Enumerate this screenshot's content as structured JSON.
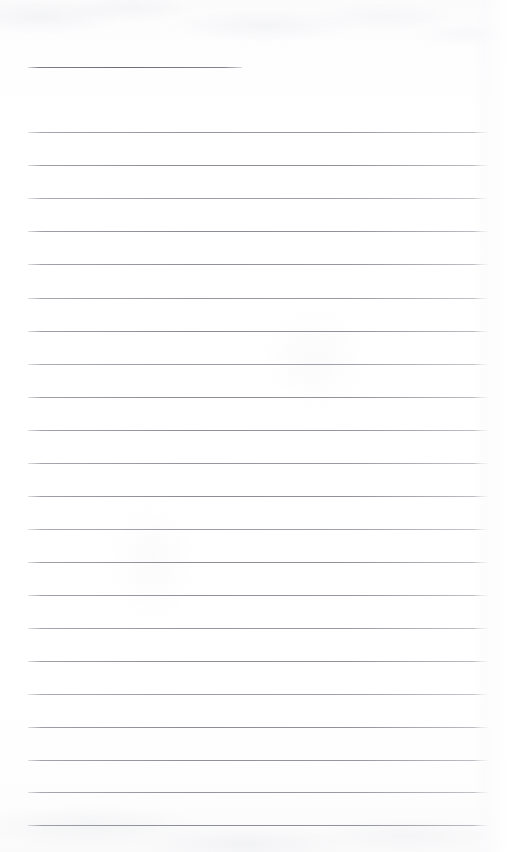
{
  "document": {
    "kind": "scanned-ruled-notebook-page",
    "page_title": "",
    "body_text": "",
    "visible_text": "",
    "page_width_px": 507,
    "page_height_px": 852
  },
  "appearance": {
    "background_color": "#fdfdfe",
    "paper_top_tone": "#fbfbfc",
    "paper_bottom_tone": "#fafafb",
    "rule_color": "#8a8c93",
    "rule_color_dark": "#6c6e77",
    "edge_band_color": "#fafafc"
  },
  "ruling": {
    "left_margin_px": 28,
    "right_edge_px": 488,
    "line_spacing_px": 33.2,
    "short_rule": {
      "label": "title-rule",
      "y_px": 67,
      "x_start_px": 28,
      "x_end_px": 242,
      "weight": "dark"
    },
    "lines": [
      {
        "y_px": 132,
        "x_start_px": 28,
        "x_end_px": 488,
        "variant": "v1"
      },
      {
        "y_px": 165,
        "x_start_px": 28,
        "x_end_px": 488,
        "variant": "v2"
      },
      {
        "y_px": 198,
        "x_start_px": 28,
        "x_end_px": 488,
        "variant": "v3"
      },
      {
        "y_px": 231,
        "x_start_px": 28,
        "x_end_px": 488,
        "variant": "v2"
      },
      {
        "y_px": 264,
        "x_start_px": 28,
        "x_end_px": 488,
        "variant": "v4"
      },
      {
        "y_px": 298,
        "x_start_px": 28,
        "x_end_px": 488,
        "variant": "v1"
      },
      {
        "y_px": 331,
        "x_start_px": 28,
        "x_end_px": 488,
        "variant": "v2"
      },
      {
        "y_px": 364,
        "x_start_px": 28,
        "x_end_px": 488,
        "variant": "v3"
      },
      {
        "y_px": 397,
        "x_start_px": 28,
        "x_end_px": 488,
        "variant": "v2"
      },
      {
        "y_px": 430,
        "x_start_px": 28,
        "x_end_px": 488,
        "variant": "v4"
      },
      {
        "y_px": 463,
        "x_start_px": 28,
        "x_end_px": 488,
        "variant": "v1"
      },
      {
        "y_px": 496,
        "x_start_px": 28,
        "x_end_px": 488,
        "variant": "v2"
      },
      {
        "y_px": 529,
        "x_start_px": 28,
        "x_end_px": 488,
        "variant": "v3"
      },
      {
        "y_px": 562,
        "x_start_px": 28,
        "x_end_px": 488,
        "variant": "v2"
      },
      {
        "y_px": 595,
        "x_start_px": 28,
        "x_end_px": 488,
        "variant": "v4"
      },
      {
        "y_px": 628,
        "x_start_px": 28,
        "x_end_px": 488,
        "variant": "v1"
      },
      {
        "y_px": 661,
        "x_start_px": 28,
        "x_end_px": 488,
        "variant": "v2"
      },
      {
        "y_px": 694,
        "x_start_px": 28,
        "x_end_px": 488,
        "variant": "v3"
      },
      {
        "y_px": 727,
        "x_start_px": 28,
        "x_end_px": 488,
        "variant": "v2"
      },
      {
        "y_px": 760,
        "x_start_px": 28,
        "x_end_px": 488,
        "variant": "v4"
      },
      {
        "y_px": 792,
        "x_start_px": 28,
        "x_end_px": 488,
        "variant": "v1"
      },
      {
        "y_px": 825,
        "x_start_px": 28,
        "x_end_px": 488,
        "variant": "v2"
      }
    ]
  }
}
